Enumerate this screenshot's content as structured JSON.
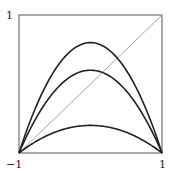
{
  "chart_data": {
    "type": "line",
    "title": "",
    "xlabel": "",
    "ylabel": "",
    "xlim": [
      -1,
      1
    ],
    "ylim": [
      0,
      1
    ],
    "x_ticks": [
      "-1",
      "1"
    ],
    "y_ticks": [
      "1"
    ],
    "grid": false,
    "legend": null,
    "series": [
      {
        "name": "curve-high",
        "function": "h*(1-x^2)",
        "peak": 0.8,
        "color": "#222222",
        "width": 1.6
      },
      {
        "name": "curve-mid",
        "function": "h*(1-x^2)",
        "peak": 0.6,
        "color": "#222222",
        "width": 1.6
      },
      {
        "name": "curve-low",
        "function": "h*(1-x^2)",
        "peak": 0.2,
        "color": "#222222",
        "width": 1.6
      },
      {
        "name": "diagonal",
        "points": [
          [
            -1,
            0
          ],
          [
            1,
            1
          ]
        ],
        "color": "#9a9a9a",
        "width": 0.9
      }
    ]
  },
  "labels": {
    "y_top": "1",
    "x_left": "−1",
    "x_right": "1"
  }
}
